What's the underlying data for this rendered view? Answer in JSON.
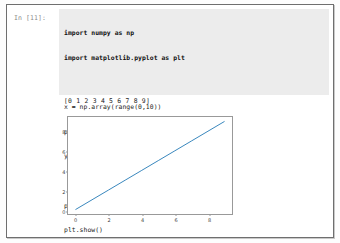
{
  "notebook": {
    "cell": {
      "prompt": "In [11]:",
      "code_lines": [
        "import numpy as np",
        "import matplotlib.pyplot as plt",
        "",
        "x = np.array(range(0,10))",
        "print(x)",
        "y = x",
        "",
        "plt.plot(x, y)",
        "plt.show()"
      ],
      "stdout": "[0 1 2 3 4 5 6 7 8 9]"
    }
  },
  "chart_data": {
    "type": "line",
    "title": "",
    "xlabel": "",
    "ylabel": "",
    "x": [
      0,
      1,
      2,
      3,
      4,
      5,
      6,
      7,
      8,
      9
    ],
    "series": [
      {
        "name": "y = x",
        "values": [
          0,
          1,
          2,
          3,
          4,
          5,
          6,
          7,
          8,
          9
        ],
        "color": "#1f77b4"
      }
    ],
    "xlim": [
      -0.45,
      9.45
    ],
    "ylim": [
      -0.45,
      9.45
    ],
    "xticks": [
      "0",
      "2",
      "4",
      "6",
      "8"
    ],
    "xtick_values": [
      0,
      2,
      4,
      6,
      8
    ],
    "yticks": [
      "0",
      "2",
      "4",
      "6",
      "8"
    ],
    "ytick_values": [
      0,
      2,
      4,
      6,
      8
    ],
    "grid": false,
    "legend": false
  }
}
